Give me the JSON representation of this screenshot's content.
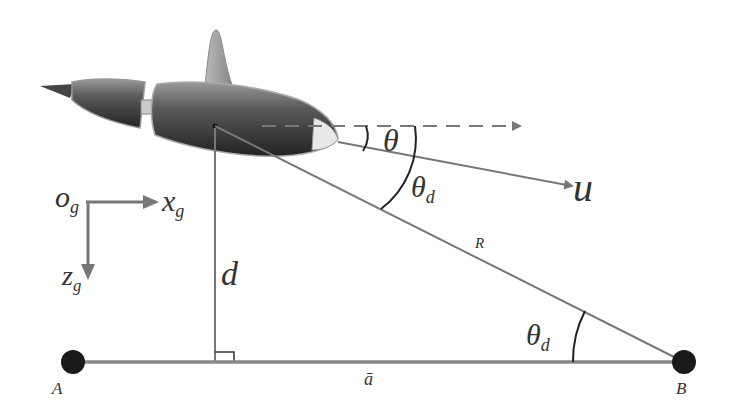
{
  "diagram": {
    "type": "geometry / vehicle kinematics diagram",
    "colors": {
      "line": "#777777",
      "arc": "#222222",
      "point": "#1a1a1a",
      "body_dark": "#3a3a3a",
      "body_light": "#c8c8c8"
    },
    "labels": {
      "theta": "θ",
      "theta_d_upper": "θ",
      "theta_d_upper_sub": "d",
      "theta_d_lower": "θ",
      "theta_d_lower_sub": "d",
      "u": "u",
      "R": "R",
      "d": "d",
      "origin": "o",
      "origin_sub": "g",
      "x_axis": "x",
      "x_axis_sub": "g",
      "z_axis": "z",
      "z_axis_sub": "g",
      "point_A": "A",
      "point_B": "B",
      "baseline": "ā"
    },
    "elements": [
      "underwater vehicle (AUV) body",
      "dashed horizontal reference arrow",
      "velocity vector u",
      "line of sight R to point B",
      "perpendicular distance d to baseline",
      "baseline AB",
      "coordinate frame o_g x_g z_g"
    ]
  }
}
